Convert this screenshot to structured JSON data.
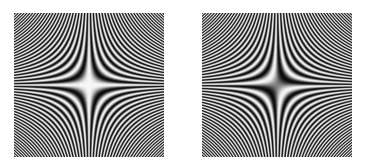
{
  "background": "#ffffff",
  "panels": [
    {
      "name": "cosine-xy-pattern",
      "x": 14,
      "y": 13,
      "width": 150,
      "height": 144,
      "function": "cos",
      "frequency": 52,
      "center_brightness": "bright"
    },
    {
      "name": "sine-xy-pattern",
      "x": 202,
      "y": 13,
      "width": 150,
      "height": 144,
      "function": "sin",
      "frequency": 52,
      "center_brightness": "dark"
    }
  ]
}
